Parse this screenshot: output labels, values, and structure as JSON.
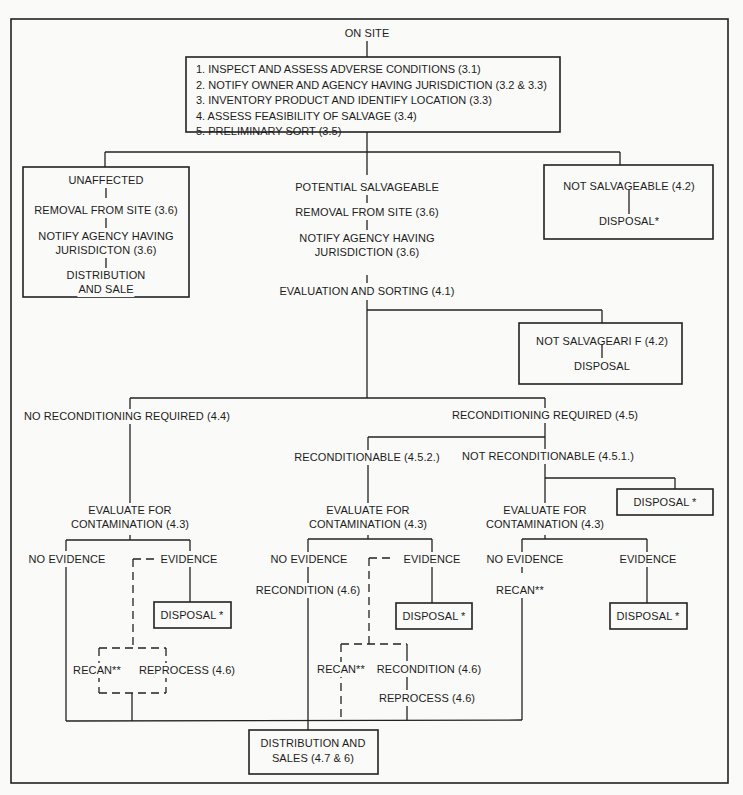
{
  "title": "ON SITE",
  "main_steps": [
    "1. INSPECT AND ASSESS ADVERSE CONDITIONS (3.1)",
    "2. NOTIFY OWNER AND AGENCY HAVING JURISDICTION (3.2 & 3.3)",
    "3. INVENTORY PRODUCT AND IDENTIFY LOCATION (3.3)",
    "4. ASSESS FEASIBILITY OF SALVAGE (3.4)",
    "5. PRELIMINARY SORT (3.5)"
  ],
  "unaffected": {
    "title": "UNAFFECTED",
    "removal": "REMOVAL FROM SITE (3.6)",
    "notify_1": "NOTIFY AGENCY HAVING",
    "notify_2": "JURISDICTON (3.6)",
    "dist_1": "DISTRIBUTION",
    "dist_2": "AND SALE"
  },
  "potential": {
    "title": "POTENTIAL SALVAGEABLE",
    "removal": "REMOVAL FROM SITE (3.6)",
    "notify_1": "NOTIFY AGENCY HAVING",
    "notify_2": "JURISDICTION (3.6)",
    "evaluation": "EVALUATION AND SORTING (4.1)"
  },
  "not_salvageable_top": {
    "title": "NOT SALVAGEABLE (4.2)",
    "disposal": "DISPOSAL*"
  },
  "not_salvageable_mid": {
    "title": "NOT SALVAGEARI F (4.2)",
    "disposal": "DISPOSAL"
  },
  "no_recond": {
    "title": "NO RECONDITIONING REQUIRED (4.4)",
    "eval_1": "EVALUATE FOR",
    "eval_2": "CONTAMINATION (4.3)",
    "no_evidence": "NO EVIDENCE",
    "evidence": "EVIDENCE",
    "disposal": "DISPOSAL *",
    "recan": "RECAN**",
    "reprocess": "REPROCESS (4.6)"
  },
  "recond_required": {
    "title": "RECONDITIONING REQUIRED (4.5)"
  },
  "reconditionable": {
    "title": "RECONDITIONABLE (4.5.2.)",
    "eval_1": "EVALUATE FOR",
    "eval_2": "CONTAMINATION (4.3)",
    "no_evidence": "NO EVIDENCE",
    "recondition": "RECONDITION (4.6)",
    "evidence": "EVIDENCE",
    "disposal": "DISPOSAL *",
    "recan": "RECAN**",
    "recondition_2": "RECONDITION (4.6)",
    "reprocess": "REPROCESS (4.6)"
  },
  "not_reconditionable": {
    "title": "NOT RECONDITIONABLE (4.5.1.)",
    "disposal_side": "DISPOSAL *",
    "eval_1": "EVALUATE FOR",
    "eval_2": "CONTAMINATION (4.3)",
    "no_evidence": "NO EVIDENCE",
    "recan": "RECAN**",
    "evidence": "EVIDENCE",
    "disposal": "DISPOSAL *"
  },
  "final": {
    "line_1": "DISTRIBUTION AND",
    "line_2": "SALES (4.7 & 6)"
  }
}
